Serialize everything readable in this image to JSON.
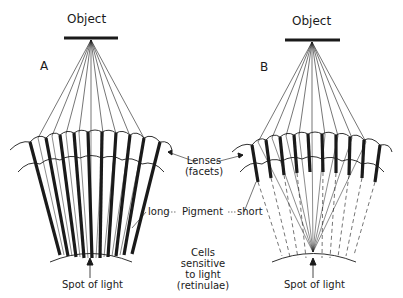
{
  "diagram": {
    "panel_a": {
      "letter": "A",
      "object_label": "Object",
      "spot_label": "Spot of light"
    },
    "panel_b": {
      "letter": "B",
      "object_label": "Object",
      "spot_label": "Spot of light"
    },
    "labels": {
      "lenses_line1": "Lenses",
      "lenses_line2": "(facets)",
      "pigment_long": "long",
      "pigment": "Pigment",
      "pigment_short": "short",
      "cells_line1": "Cells",
      "cells_line2": "sensitive",
      "cells_line3": "to light",
      "cells_line4": "(retinulae)"
    },
    "colors": {
      "ink": "#1a1a1a",
      "background": "#ffffff"
    }
  }
}
